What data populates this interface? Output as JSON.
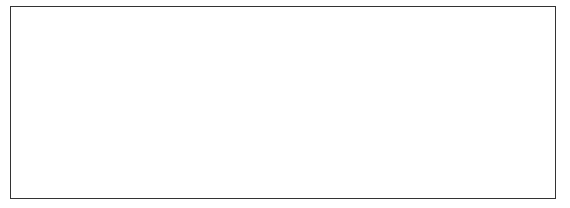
{
  "diagram": {
    "type": "binary-search-tree",
    "colors": {
      "edge": "#111111",
      "path_edge": "#999999",
      "visited_key": "#bbbbbb",
      "node_fill": "#f2f2f2"
    },
    "labels": {
      "left": "L",
      "right": "R"
    },
    "nodes": [
      {
        "id": "n9",
        "key": "9",
        "visited": true,
        "x": 278,
        "y": 32,
        "w": 56
      },
      {
        "id": "n5",
        "key": "5",
        "visited": true,
        "x": 135,
        "y": 78,
        "w": 56
      },
      {
        "id": "n14",
        "key": "14",
        "visited": false,
        "x": 417,
        "y": 78,
        "w": 56
      },
      {
        "id": "n3",
        "key": "3",
        "visited": false,
        "x": 62,
        "y": 124,
        "w": 56
      },
      {
        "id": "n7",
        "key": "7",
        "visited": true,
        "x": 205,
        "y": 124,
        "w": 56
      },
      {
        "id": "n11",
        "key": "11",
        "visited": false,
        "x": 349,
        "y": 124,
        "w": 56
      },
      {
        "id": "n16",
        "key": "16",
        "visited": false,
        "x": 492,
        "y": 124,
        "w": 56
      },
      {
        "id": "n2",
        "key": "2",
        "visited": false,
        "x": 27,
        "y": 164,
        "w": 52
      },
      {
        "id": "n4",
        "key": "4",
        "visited": false,
        "x": 98,
        "y": 164,
        "w": 52
      },
      {
        "id": "n6",
        "key": "6",
        "visited": false,
        "x": 170,
        "y": 164,
        "w": 52
      },
      {
        "id": "n8",
        "key": "8",
        "visited": true,
        "x": 242,
        "y": 164,
        "w": 52
      },
      {
        "id": "n10",
        "key": "10",
        "visited": false,
        "x": 313,
        "y": 164,
        "w": 52
      },
      {
        "id": "n12",
        "key": "12",
        "visited": false,
        "x": 384,
        "y": 164,
        "w": 52
      },
      {
        "id": "n15",
        "key": "15",
        "visited": false,
        "x": 456,
        "y": 164,
        "w": 55
      }
    ],
    "edges": [
      {
        "from": "n9",
        "to": "n5",
        "path": true
      },
      {
        "from": "n9",
        "to": "n14",
        "path": false
      },
      {
        "from": "n5",
        "to": "n3",
        "path": false
      },
      {
        "from": "n5",
        "to": "n7",
        "path": true
      },
      {
        "from": "n14",
        "to": "n11",
        "path": false
      },
      {
        "from": "n14",
        "to": "n16",
        "path": false
      },
      {
        "from": "n3",
        "to": "n2",
        "path": false
      },
      {
        "from": "n3",
        "to": "n4",
        "path": false
      },
      {
        "from": "n7",
        "to": "n6",
        "path": false
      },
      {
        "from": "n7",
        "to": "n8",
        "path": true
      },
      {
        "from": "n11",
        "to": "n10",
        "path": false
      },
      {
        "from": "n11",
        "to": "n12",
        "path": false
      },
      {
        "from": "n16",
        "to": "n15",
        "path": false
      }
    ],
    "steps": [
      {
        "label": "1",
        "x": 303,
        "y": 22
      },
      {
        "label": "2",
        "x": 204,
        "y": 50
      },
      {
        "label": "3",
        "x": 212,
        "y": 100
      },
      {
        "label": "4",
        "x": 270,
        "y": 146
      },
      {
        "label": "5",
        "x": 267,
        "y": 184
      }
    ]
  }
}
